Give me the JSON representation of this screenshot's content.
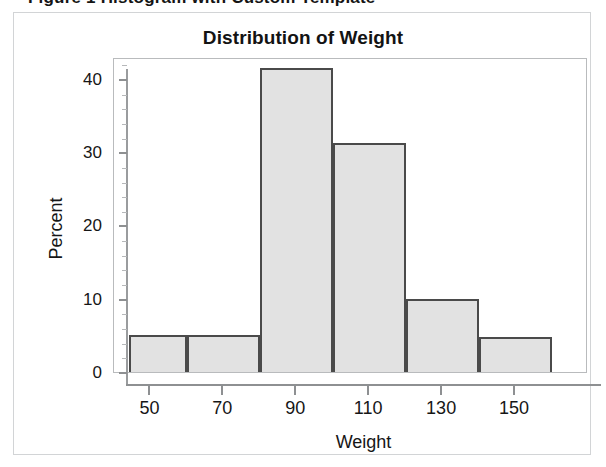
{
  "caption": {
    "text": "Figure 1  Histogram with Custom Template"
  },
  "chart_data": {
    "type": "bar",
    "title": "Distribution of Weight",
    "xlabel": "Weight",
    "ylabel": "Percent",
    "xlim": [
      40,
      170
    ],
    "ylim": [
      0,
      43
    ],
    "grid": false,
    "legend": null,
    "bin_width": 20,
    "bin_edges": [
      44,
      60,
      80,
      100,
      120,
      140,
      160
    ],
    "categories": [
      "44-60",
      "60-80",
      "80-100",
      "100-120",
      "120-140",
      "140-160"
    ],
    "values": [
      5.0,
      5.0,
      41.5,
      31.3,
      10.0,
      4.8
    ],
    "xticks": [
      50,
      70,
      90,
      110,
      130,
      150
    ],
    "yticks": [
      0,
      10,
      20,
      30,
      40
    ],
    "bar_fill": "#e2e2e2",
    "bar_stroke": "#4a4a4a"
  }
}
